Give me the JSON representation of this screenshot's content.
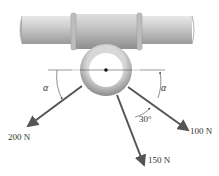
{
  "figure": {
    "forces": [
      {
        "label": "200 N",
        "direction": "down-left, angle alpha below horizontal"
      },
      {
        "label": "150 N",
        "direction": "down, 30° from 100 N force"
      },
      {
        "label": "100 N",
        "direction": "down-right, angle alpha below horizontal"
      }
    ],
    "angles": {
      "left": "α",
      "right": "α",
      "between": "30°"
    },
    "colors": {
      "pipe": "#c8c8c8",
      "arrow": "#555555",
      "ring": "#b8b8b8"
    }
  }
}
